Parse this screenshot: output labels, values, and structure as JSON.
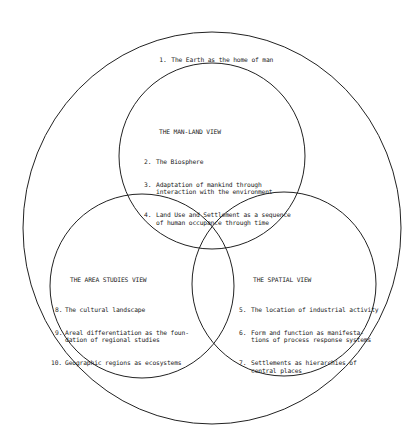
{
  "diagram": {
    "outer": {
      "item": {
        "num": "1.",
        "text": "The Earth as the home of man"
      }
    },
    "man_land": {
      "title": "THE MAN-LAND VIEW",
      "items": [
        {
          "num": "2.",
          "lines": [
            "The Biosphere"
          ]
        },
        {
          "num": "3.",
          "lines": [
            "Adaptation of mankind through",
            "interaction with the environment"
          ]
        },
        {
          "num": "4.",
          "lines": [
            "Land Use and Settlement as a sequence",
            "of human occupance through time"
          ]
        }
      ]
    },
    "area_studies": {
      "title": "THE AREA STUDIES VIEW",
      "items": [
        {
          "num": "8.",
          "lines": [
            "The cultural landscape"
          ]
        },
        {
          "num": "9.",
          "lines": [
            "Areal differentiation as the foun-",
            "dation of regional studies"
          ]
        },
        {
          "num": "10.",
          "lines": [
            "Geographic regions as ecosystems"
          ]
        }
      ]
    },
    "spatial": {
      "title": "THE SPATIAL VIEW",
      "items": [
        {
          "num": "5.",
          "lines": [
            "The location of industrial activity"
          ]
        },
        {
          "num": "6.",
          "lines": [
            "Form and function as manifesta-",
            "tions of process response systems"
          ]
        },
        {
          "num": "7.",
          "lines": [
            "Settlements as hierarchies of",
            "central places"
          ]
        }
      ]
    },
    "colors": {
      "stroke": "#222222",
      "background": "#ffffff",
      "text": "#222222"
    }
  }
}
